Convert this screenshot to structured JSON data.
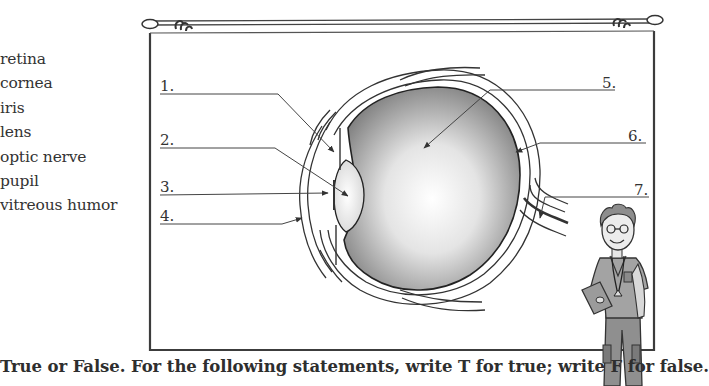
{
  "word_bank": {
    "title": "",
    "items": [
      "retina",
      "cornea",
      "iris",
      "lens",
      "optic nerve",
      "pupil",
      "vitreous humor"
    ]
  },
  "diagram": {
    "labels": [
      {
        "number": "1.",
        "target": "iris"
      },
      {
        "number": "2.",
        "target": "lens"
      },
      {
        "number": "3.",
        "target": "pupil"
      },
      {
        "number": "4.",
        "target": "cornea"
      },
      {
        "number": "5.",
        "target": "vitreous humor"
      },
      {
        "number": "6.",
        "target": "retina"
      },
      {
        "number": "7.",
        "target": "optic nerve"
      }
    ]
  },
  "character": {
    "description": "cartoon doctor with glasses, stethoscope and clipboard"
  },
  "instructions": "True or False. For the following statements, write T for true; write F for false.",
  "colors": {
    "line": "#3a3a3a",
    "text": "#2e2e2e",
    "eye_shade": "#8a8a8a",
    "background": "#ffffff"
  }
}
